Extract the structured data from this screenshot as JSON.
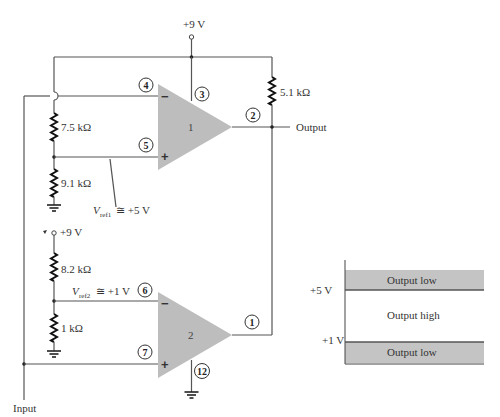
{
  "supply": {
    "top_label": "+9 V",
    "bottom_label": "+9 V"
  },
  "resistors": {
    "r_top_right": "5.1 kΩ",
    "r1_upper": "7.5 kΩ",
    "r1_lower": "9.1 kΩ",
    "r2_upper": "8.2 kΩ",
    "r2_lower": "1 kΩ"
  },
  "references": {
    "vref1_main": "V",
    "vref1_sub": "ref1",
    "vref1_value": "≅ +5 V",
    "vref2_main": "V",
    "vref2_sub": "ref2",
    "vref2_value": "≅ +1 V"
  },
  "opamps": [
    {
      "number": "1",
      "minus": "−",
      "plus": "+"
    },
    {
      "number": "2",
      "minus": "−",
      "plus": "+"
    }
  ],
  "pins": {
    "p1": "1",
    "p2": "2",
    "p3": "3",
    "p4": "4",
    "p5": "5",
    "p6": "6",
    "p7": "7",
    "p12": "12"
  },
  "io": {
    "output_label": "Output",
    "input_label": "Input"
  },
  "window_chart": {
    "upper_threshold": "+5 V",
    "lower_threshold": "+1 V",
    "region_top": "Output low",
    "region_middle": "Output high",
    "region_bottom": "Output low"
  },
  "colors": {
    "opamp_fill": "#bdbdbd",
    "band_fill": "#c4c4c4",
    "wire": "#555555"
  }
}
